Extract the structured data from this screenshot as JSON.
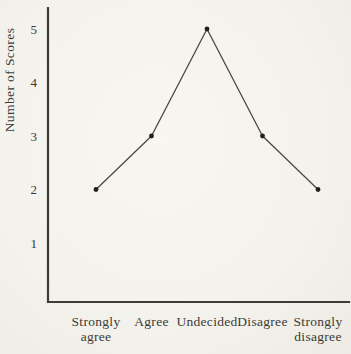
{
  "figure": {
    "kind": "scanned line chart figure",
    "background_color": "#f4f2ec"
  },
  "chart_data": {
    "type": "line",
    "title": "",
    "xlabel": "",
    "ylabel": "Number of Scores",
    "categories": [
      "Strongly agree",
      "Agree",
      "Undecided",
      "Disagree",
      "Strongly disagree"
    ],
    "category_label_lines": [
      [
        "Strongly",
        "agree"
      ],
      [
        "Agree"
      ],
      [
        "Undecided"
      ],
      [
        "Disagree"
      ],
      [
        "Strongly",
        "disagree"
      ]
    ],
    "values": [
      2,
      3,
      5,
      3,
      2
    ],
    "yticks": [
      1,
      2,
      3,
      4,
      5
    ],
    "ylim": [
      0,
      5.5
    ],
    "grid": false,
    "legend": "none",
    "marker": "filled-dot",
    "line_color": "#4a4a45",
    "marker_color": "#20201d",
    "axis_color": "#3c3b37",
    "text_color": "#3d3a33"
  }
}
